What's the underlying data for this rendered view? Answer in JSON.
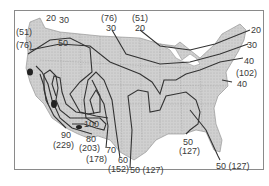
{
  "map": {
    "region": "Contiguous United States",
    "contour_color": "#333333",
    "land_color": "#cfcfcf",
    "water_color": "#ffffff",
    "frame_color": "#8a8a8a",
    "labels": [
      {
        "id": "nw-20",
        "text": "20",
        "x": 46,
        "y": 14
      },
      {
        "id": "nw-30",
        "text": "30",
        "x": 59,
        "y": 16
      },
      {
        "id": "nw-51",
        "text": "(51)",
        "x": 16,
        "y": 28
      },
      {
        "id": "nw-76",
        "text": "(76)",
        "x": 16,
        "y": 41
      },
      {
        "id": "nw-50",
        "text": "50",
        "x": 58,
        "y": 39
      },
      {
        "id": "n-76",
        "text": "(76)",
        "x": 101,
        "y": 14
      },
      {
        "id": "n-30",
        "text": "30",
        "x": 106,
        "y": 24
      },
      {
        "id": "n-51",
        "text": "(51)",
        "x": 132,
        "y": 14
      },
      {
        "id": "n-20",
        "text": "20",
        "x": 135,
        "y": 24
      },
      {
        "id": "ne-20",
        "text": "20",
        "x": 251,
        "y": 26
      },
      {
        "id": "ne-30",
        "text": "30",
        "x": 247,
        "y": 41
      },
      {
        "id": "ne-40",
        "text": "40",
        "x": 244,
        "y": 57
      },
      {
        "id": "ne-102",
        "text": "(102)",
        "x": 236,
        "y": 69
      },
      {
        "id": "ne-40b",
        "text": "40",
        "x": 237,
        "y": 80
      },
      {
        "id": "sw-100",
        "text": "100",
        "x": 84,
        "y": 120
      },
      {
        "id": "sw-90",
        "text": "90",
        "x": 61,
        "y": 131
      },
      {
        "id": "sw-229",
        "text": "(229)",
        "x": 53,
        "y": 141
      },
      {
        "id": "sw-80",
        "text": "80",
        "x": 86,
        "y": 135
      },
      {
        "id": "sw-203",
        "text": "(203)",
        "x": 79,
        "y": 144
      },
      {
        "id": "s-178",
        "text": "(178)",
        "x": 86,
        "y": 155
      },
      {
        "id": "s-70",
        "text": "70",
        "x": 106,
        "y": 146
      },
      {
        "id": "s-60",
        "text": "60",
        "x": 118,
        "y": 156
      },
      {
        "id": "s-152",
        "text": "(152)",
        "x": 108,
        "y": 165
      },
      {
        "id": "s-50",
        "text": "50 (127)",
        "x": 130,
        "y": 166
      },
      {
        "id": "se-50",
        "text": "50",
        "x": 183,
        "y": 138
      },
      {
        "id": "se-127",
        "text": "(127)",
        "x": 179,
        "y": 147
      },
      {
        "id": "fl-50",
        "text": "50 (127)",
        "x": 216,
        "y": 162
      }
    ]
  }
}
